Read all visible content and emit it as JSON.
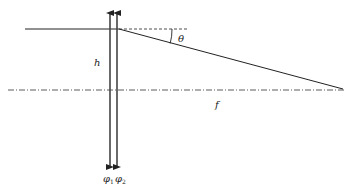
{
  "diagram": {
    "type": "optics-ray-diagram",
    "labels": {
      "height": "h",
      "angle": "θ",
      "focal_length": "f",
      "lens1": "φ",
      "lens1_sub": "1",
      "lens2": "φ",
      "lens2_sub": "2"
    },
    "colors": {
      "line": "#222222",
      "lens_arrow": "#333333"
    }
  }
}
